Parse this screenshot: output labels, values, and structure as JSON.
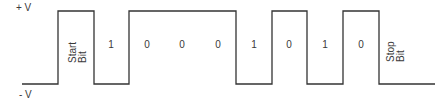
{
  "diagram": {
    "type": "serial-waveform",
    "levels": {
      "high_label": "+ V",
      "low_label": "- V"
    },
    "line_color": "#333333",
    "bits": [
      {
        "label_line1": "Start",
        "label_line2": "Bit",
        "level": "high",
        "vertical": true
      },
      {
        "label": "1",
        "level": "low"
      },
      {
        "label": "0",
        "level": "high"
      },
      {
        "label": "0",
        "level": "high"
      },
      {
        "label": "0",
        "level": "high"
      },
      {
        "label": "1",
        "level": "low"
      },
      {
        "label": "0",
        "level": "high"
      },
      {
        "label": "1",
        "level": "low"
      },
      {
        "label": "0",
        "level": "high"
      },
      {
        "label_line1": "Stop",
        "label_line2": "Bit",
        "level": "low",
        "vertical": true
      }
    ]
  }
}
